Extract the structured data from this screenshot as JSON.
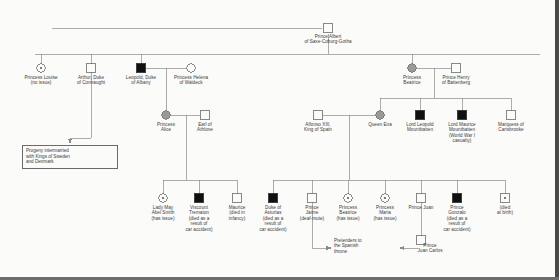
{
  "diagram": {
    "colors": {
      "line": "#8a8a88",
      "text": "#3a3a38",
      "affected_fill": "#101010",
      "carrier_fill": "#9a9a98",
      "unaffected_fill": "#fbfbfa",
      "border": "#6a6a68",
      "page_background": "#fbfbfa",
      "edge_strip": "#4a4a4a"
    },
    "symbol_legend": {
      "square": "male",
      "circle": "female",
      "filled": "affected (hemophilia)",
      "dotted": "carrier",
      "open": "unaffected"
    },
    "notes": {
      "progeny_box": "Progeny intermarried\nwith Kings of Sweden\nand Denmark",
      "pretenders": "Pretenders to\nthe Spanish\nthrone"
    },
    "people": [
      {
        "id": "albert",
        "name": "Prince Albert\nof Saxe-Coburg-Gotha",
        "shape": "square",
        "status": "open",
        "x": 328,
        "y": 28,
        "label_x": 328,
        "label_y": 34
      },
      {
        "id": "louise",
        "name": "Princess Louise",
        "sub": "(no issue)",
        "shape": "circle",
        "status": "dotted",
        "x": 41,
        "y": 68,
        "label_x": 41,
        "label_y": 75
      },
      {
        "id": "arthur",
        "name": "Arthur, Duke\nof Connaught",
        "shape": "square",
        "status": "open",
        "x": 91,
        "y": 68,
        "label_x": 91,
        "label_y": 75
      },
      {
        "id": "leopold",
        "name": "Leopold, Duke\nof Albany",
        "shape": "square",
        "status": "filled",
        "x": 141,
        "y": 68,
        "label_x": 141,
        "label_y": 75
      },
      {
        "id": "helena",
        "name": "Princess Helena\nof Waldeck",
        "shape": "circle",
        "status": "open",
        "x": 191,
        "y": 68,
        "label_x": 191,
        "label_y": 75
      },
      {
        "id": "beatrice",
        "name": "Princess\nBeatrice",
        "shape": "circle",
        "status": "carrier",
        "x": 412,
        "y": 68,
        "label_x": 412,
        "label_y": 75
      },
      {
        "id": "henry",
        "name": "Prince Henry\nof Battenberg",
        "shape": "square",
        "status": "open",
        "x": 456,
        "y": 68,
        "label_x": 456,
        "label_y": 75
      },
      {
        "id": "alice",
        "name": "Princess\nAlice",
        "shape": "circle",
        "status": "carrier",
        "x": 166,
        "y": 115,
        "label_x": 166,
        "label_y": 122
      },
      {
        "id": "athlone",
        "name": "Earl of\nAthlone",
        "shape": "square",
        "status": "open",
        "x": 205,
        "y": 115,
        "label_x": 205,
        "label_y": 122
      },
      {
        "id": "alfonso",
        "name": "Alfonso XIII,\nKing of Spain",
        "shape": "square",
        "status": "open",
        "x": 318,
        "y": 115,
        "label_x": 318,
        "label_y": 122
      },
      {
        "id": "ena",
        "name": "Queen Ena",
        "shape": "circle",
        "status": "carrier",
        "x": 380,
        "y": 115,
        "label_x": 380,
        "label_y": 122
      },
      {
        "id": "leopold_mb",
        "name": "Lord Leopold\nMountbatten",
        "shape": "square",
        "status": "filled",
        "x": 420,
        "y": 115,
        "label_x": 420,
        "label_y": 122
      },
      {
        "id": "maurice_mb",
        "name": "Lord Maurice\nMountbatten",
        "sub": "(World War I\ncasualty)",
        "shape": "square",
        "status": "filled",
        "x": 462,
        "y": 115,
        "label_x": 462,
        "label_y": 122
      },
      {
        "id": "carisbrooke",
        "name": "Marquess of\nCarisbrooke",
        "shape": "square",
        "status": "open",
        "x": 511,
        "y": 115,
        "label_x": 511,
        "label_y": 122
      },
      {
        "id": "lady_may",
        "name": "Lady May\nAbel Smith",
        "sub": "(has issue)",
        "shape": "circle",
        "status": "dotted",
        "x": 163,
        "y": 198,
        "label_x": 163,
        "label_y": 205
      },
      {
        "id": "trematon",
        "name": "Viscount\nTrematon",
        "sub": "(died as a\nresult of\ncar accident)",
        "shape": "square",
        "status": "filled",
        "x": 199,
        "y": 198,
        "label_x": 199,
        "label_y": 205
      },
      {
        "id": "maurice_albany",
        "name": "Maurice",
        "sub": "(died in\ninfancy)",
        "shape": "square",
        "status": "open",
        "x": 237,
        "y": 198,
        "label_x": 237,
        "label_y": 205
      },
      {
        "id": "asturias",
        "name": "Duke of\nAsturias",
        "sub": "(died as a\nresult of\ncar accident)",
        "shape": "square",
        "status": "filled",
        "x": 273,
        "y": 198,
        "label_x": 273,
        "label_y": 205
      },
      {
        "id": "jaime",
        "name": "Prince\nJaime",
        "sub": "(deaf-mute)",
        "shape": "square",
        "status": "open",
        "x": 312,
        "y": 198,
        "label_x": 312,
        "label_y": 205
      },
      {
        "id": "beatrice2",
        "name": "Princess\nBeatrice",
        "sub": "(has issue)",
        "shape": "circle",
        "status": "dotted",
        "x": 348,
        "y": 198,
        "label_x": 348,
        "label_y": 205
      },
      {
        "id": "maria",
        "name": "Princess\nMaria",
        "sub": "(has issue)",
        "shape": "circle",
        "status": "dotted",
        "x": 385,
        "y": 198,
        "label_x": 385,
        "label_y": 205
      },
      {
        "id": "juan",
        "name": "Prince Juan",
        "shape": "square",
        "status": "open",
        "x": 421,
        "y": 198,
        "label_x": 421,
        "label_y": 205
      },
      {
        "id": "gonzalo",
        "name": "Prince\nGonzalo",
        "sub": "(died as a\nresult of\ncar accident)",
        "shape": "square",
        "status": "filled",
        "x": 457,
        "y": 198,
        "label_x": 457,
        "label_y": 205
      },
      {
        "id": "died_at_birth",
        "name": "(died\nat birth)",
        "shape": "square",
        "status": "dotted",
        "x": 505,
        "y": 198,
        "label_x": 505,
        "label_y": 205
      },
      {
        "id": "juan_carlos",
        "name": "Prince\nJuan Carlos",
        "shape": "square",
        "status": "open",
        "x": 421,
        "y": 240,
        "label_x": 430,
        "label_y": 243
      }
    ]
  }
}
